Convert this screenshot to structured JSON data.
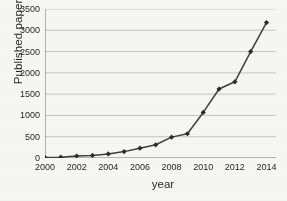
{
  "chart_data": {
    "type": "line",
    "title": "",
    "xlabel": "year",
    "ylabel": "Published papers",
    "x": [
      2000,
      2001,
      2002,
      2003,
      2004,
      2005,
      2006,
      2007,
      2008,
      2009,
      2010,
      2011,
      2012,
      2013,
      2014
    ],
    "values": [
      10,
      20,
      45,
      60,
      95,
      150,
      230,
      310,
      490,
      570,
      1070,
      1620,
      1790,
      2500,
      3180
    ],
    "series": [
      {
        "name": "Published papers",
        "values": [
          10,
          20,
          45,
          60,
          95,
          150,
          230,
          310,
          490,
          570,
          1070,
          1620,
          1790,
          2500,
          3180
        ]
      }
    ],
    "xlim": [
      2000,
      2014.6
    ],
    "ylim": [
      0,
      3500
    ],
    "ytick_labels": [
      "0",
      "500",
      "1000",
      "1500",
      "2000",
      "2500",
      "3000",
      "3500"
    ],
    "ytick_values": [
      0,
      500,
      1000,
      1500,
      2000,
      2500,
      3000,
      3500
    ],
    "xtick_labels": [
      "2000",
      "2002",
      "2004",
      "2006",
      "2008",
      "2010",
      "2012",
      "2014"
    ],
    "xtick_values": [
      2000,
      2002,
      2004,
      2006,
      2008,
      2010,
      2012,
      2014
    ],
    "xtick_minor_values": [
      2000,
      2001,
      2002,
      2003,
      2004,
      2005,
      2006,
      2007,
      2008,
      2009,
      2010,
      2011,
      2012,
      2013,
      2014
    ],
    "grid": true,
    "grid_axis": "y",
    "legend": false,
    "legend_position": "none",
    "marker": "diamond",
    "line_color": "#3a3a3a",
    "marker_color": "#262626",
    "grid_color": "#b9b9b9",
    "axis_color": "#6e6e6e",
    "background_color": "#fbfbfa"
  }
}
